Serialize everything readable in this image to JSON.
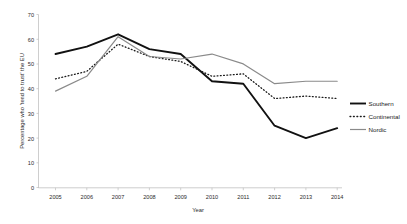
{
  "chart_data": {
    "type": "line",
    "title": "",
    "xlabel": "Year",
    "ylabel": "Percentage who 'tend to trust' the EU",
    "categories": [
      "2005",
      "2006",
      "2007",
      "2008",
      "2009",
      "2010",
      "2011",
      "2012",
      "2013",
      "2014"
    ],
    "x": [
      2005,
      2006,
      2007,
      2008,
      2009,
      2010,
      2011,
      2012,
      2013,
      2014
    ],
    "xlim": [
      2005,
      2014
    ],
    "ylim": [
      0,
      70
    ],
    "y_ticks": [
      0,
      10,
      20,
      30,
      40,
      50,
      60,
      70
    ],
    "y_tick_labels": [
      "0",
      "10",
      "20",
      "30",
      "40",
      "50",
      "60",
      "70"
    ],
    "grid": false,
    "legend_position": "right",
    "series": [
      {
        "name": "Southern",
        "style": "solid",
        "color": "#111111",
        "width": 1.9,
        "values": [
          54,
          57,
          62,
          56,
          54,
          43,
          42,
          25,
          20,
          24
        ]
      },
      {
        "name": "Continental",
        "style": "dotted",
        "color": "#1a1a1a",
        "width": 1.3,
        "values": [
          44,
          47,
          58,
          53,
          51,
          45,
          46,
          36,
          37,
          36
        ]
      },
      {
        "name": "Nordic",
        "style": "solid",
        "color": "#8a8a8a",
        "width": 1.2,
        "values": [
          39,
          45,
          61,
          53,
          52,
          54,
          50,
          42,
          43,
          43
        ]
      }
    ]
  },
  "axes": {
    "y_title": "Percentage who 'tend to trust' the EU",
    "x_title": "Year"
  },
  "legend": {
    "items": [
      {
        "label": "Southern"
      },
      {
        "label": "Continental"
      },
      {
        "label": "Nordic"
      }
    ]
  }
}
